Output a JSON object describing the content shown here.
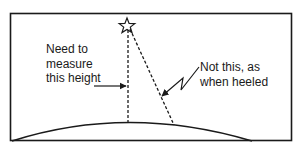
{
  "diagram": {
    "type": "mast-height-measurement",
    "labels": {
      "vertical": {
        "lines": [
          "Need to",
          "measure",
          "this height"
        ]
      },
      "heeled": {
        "lines": [
          "Not this, as",
          "when heeled"
        ]
      }
    },
    "icons": {
      "masthead": "star-icon"
    },
    "colors": {
      "stroke": "#1a1a1a",
      "background": "#ffffff"
    }
  }
}
